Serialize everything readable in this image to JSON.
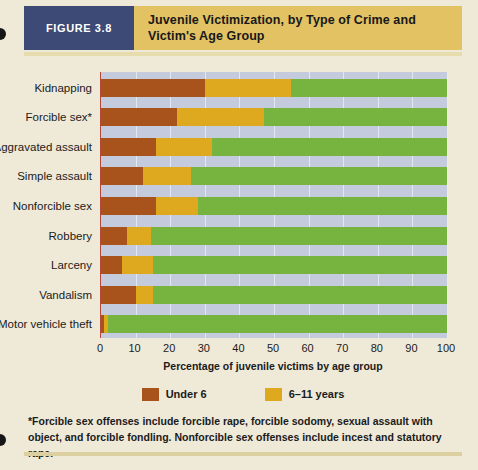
{
  "header": {
    "figure_tag": "FIGURE 3.8",
    "title": "Juvenile Victimization, by Type of Crime and Victim's Age Group"
  },
  "footnote": "*Forcible sex offenses include forcible rape, forcible sodomy, sexual assault with object, and forcible fondling. Nonforcible sex offenses include incest and statutory rape.",
  "legend": {
    "items": [
      {
        "label": "Under 6",
        "color": "#a8531c"
      },
      {
        "label": "6–11 years",
        "color": "#dfa91f"
      }
    ]
  },
  "colors": {
    "under6": "#a8531c",
    "years6to11": "#dfa91f",
    "remainder": "#76b33f",
    "plot_background": "#c3cbdd",
    "panel_background": "#efe9d8",
    "header_band": "#e2c263",
    "figure_tag_background": "#3c4a75",
    "axis_line": "#b4483a"
  },
  "chart_data": {
    "type": "bar",
    "orientation": "horizontal",
    "stacked": true,
    "title": "Juvenile Victimization, by Type of Crime and Victim's Age Group",
    "xlabel": "Percentage of juvenile victims by age group",
    "ylabel": "",
    "xlim": [
      0,
      100
    ],
    "xticks": [
      0,
      10,
      20,
      30,
      40,
      50,
      60,
      70,
      80,
      90,
      100
    ],
    "grid": true,
    "legend_position": "bottom",
    "categories": [
      "Kidnapping",
      "Forcible sex*",
      "Aggravated assault",
      "Simple assault",
      "Nonforcible sex",
      "Robbery",
      "Larceny",
      "Vandalism",
      "Motor vehicle theft"
    ],
    "series": [
      {
        "name": "Under 6",
        "color": "#a8531c",
        "values": [
          30,
          22,
          16,
          12,
          16,
          7.5,
          6,
          10,
          1
        ]
      },
      {
        "name": "6–11 years",
        "color": "#dfa91f",
        "values": [
          25,
          25,
          16,
          14,
          12,
          7,
          9,
          5,
          1
        ]
      },
      {
        "name": "12 years and older",
        "color": "#76b33f",
        "in_legend": false,
        "color_note": "remainder of bar to 100%",
        "values": [
          45,
          53,
          68,
          74,
          72,
          85.5,
          85,
          85,
          98
        ]
      }
    ]
  }
}
